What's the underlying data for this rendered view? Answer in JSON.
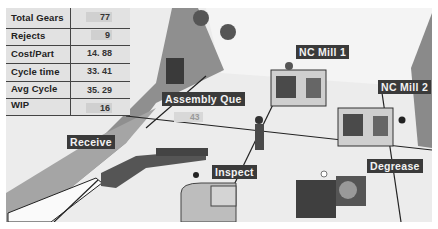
{
  "stats": {
    "rows": [
      {
        "label": "Total Gears",
        "value": "77"
      },
      {
        "label": "Rejects",
        "value": "9"
      },
      {
        "label": "Cost/Part",
        "value": "14. 88"
      },
      {
        "label": "Cycle time",
        "value": "33. 41"
      },
      {
        "label": "Avg Cycle",
        "value": "35. 29"
      },
      {
        "label": "WIP",
        "value": "16"
      }
    ]
  },
  "stations": {
    "nc_mill_1": {
      "label": "NC Mill 1"
    },
    "nc_mill_2": {
      "label": "NC Mill 2"
    },
    "assembly_que": {
      "label": "Assembly Que",
      "count": "43"
    },
    "receive": {
      "label": "Receive"
    },
    "inspect": {
      "label": "Inspect"
    },
    "degrease": {
      "label": "Degrease"
    }
  },
  "colors": {
    "floor": "#e9e9e9",
    "aisle": "#8a8a8a",
    "label_bg": "#3a3a3a",
    "label_text": "#f2f2f2"
  }
}
